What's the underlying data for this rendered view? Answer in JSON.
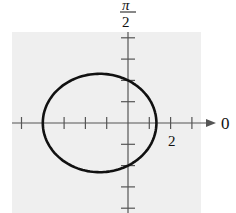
{
  "chart_data": {
    "type": "line",
    "coordinate_system": "polar",
    "title": "",
    "equation_inferred": "r = 4 / (2 + cos θ)",
    "axis_labels": {
      "polar_axis": "0",
      "vertical_axis_numerator": "π",
      "vertical_axis_denominator": "2"
    },
    "tick_labels": [
      {
        "value": 2,
        "label": "2",
        "axis": "polar"
      }
    ],
    "tick_spacing": 1,
    "x_ticks": [
      -5,
      -4,
      -3,
      -2,
      -1,
      1,
      2,
      3
    ],
    "y_ticks": [
      -4,
      -3,
      -2,
      -1,
      1,
      2,
      3,
      4
    ],
    "curve": {
      "shape": "ellipse",
      "points": [
        {
          "theta": "0",
          "r": 1.333
        },
        {
          "theta": "π/2",
          "r": 2
        },
        {
          "theta": "π",
          "r": 4
        },
        {
          "theta": "3π/2",
          "r": 2
        }
      ],
      "x_range": [
        -4,
        1.333
      ],
      "y_range": [
        -2.31,
        2.31
      ]
    },
    "grid": false,
    "background": "#eeeeee",
    "curve_color": "#111111"
  }
}
